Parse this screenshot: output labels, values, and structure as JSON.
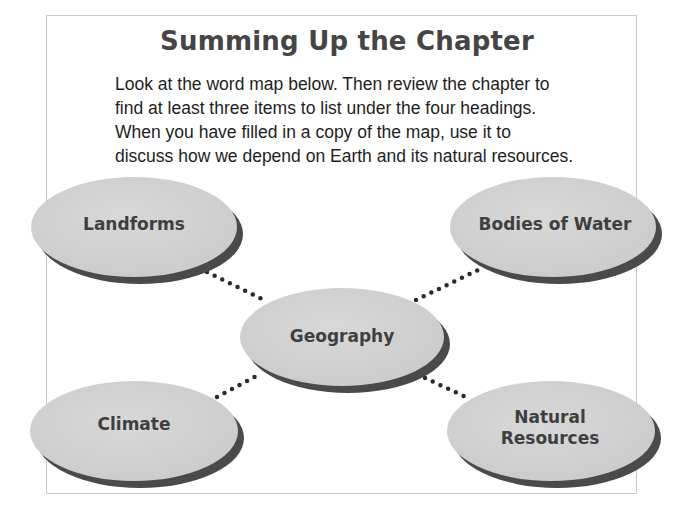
{
  "title": "Summing Up the Chapter",
  "intro_lines": [
    "Look at the word map below. Then review the chapter to",
    "find at least three items to list under the four headings.",
    "When you have filled in a copy of the map, use it to",
    "discuss how we depend on Earth and its natural resources."
  ],
  "word_map": {
    "center": {
      "label": "Geography"
    },
    "nodes": [
      {
        "label": "Landforms"
      },
      {
        "label": "Bodies of Water"
      },
      {
        "label": "Climate"
      },
      {
        "label": "Natural Resources",
        "line1": "Natural",
        "line2": "Resources"
      }
    ]
  },
  "colors": {
    "ellipse_fill": "#d2d2d2",
    "ellipse_shadow": "#4a4a4a",
    "connector": "#2a2a2a",
    "frame_border": "#c8c8c8",
    "title": "#454545"
  }
}
